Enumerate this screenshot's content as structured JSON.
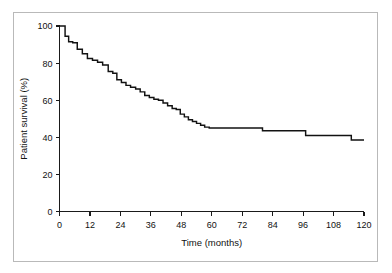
{
  "figure": {
    "frame_color": "#b9b9b9",
    "background": "#ffffff"
  },
  "chart_data": {
    "type": "line",
    "subtype": "kaplan-meier-step",
    "title": "",
    "xlabel": "Time (months)",
    "ylabel": "Patient survival (%)",
    "xlim": [
      0,
      120
    ],
    "ylim": [
      0,
      100
    ],
    "xticks": [
      0,
      12,
      24,
      36,
      48,
      60,
      72,
      84,
      96,
      108,
      120
    ],
    "xticklabels": [
      "0",
      "12",
      "24",
      "36",
      "48",
      "60",
      "72",
      "84",
      "96",
      "108",
      "120"
    ],
    "yticks": [
      0,
      20,
      40,
      60,
      80,
      100
    ],
    "yticklabels": [
      "0",
      "20",
      "40",
      "60",
      "80",
      "100"
    ],
    "grid": false,
    "legend": null,
    "line_color": "#121212",
    "series": [
      {
        "name": "Patient survival",
        "x": [
          0,
          0.8,
          2.2,
          3.6,
          5.2,
          7.0,
          9.0,
          11.0,
          13.0,
          15.0,
          17.0,
          19.2,
          21.0,
          22.6,
          24.4,
          26.2,
          28.0,
          30.0,
          31.8,
          33.6,
          35.4,
          37.2,
          39.0,
          40.8,
          42.6,
          44.4,
          46.0,
          47.6,
          49.2,
          50.8,
          52.4,
          54.0,
          55.6,
          57.2,
          59.0,
          79.5,
          80.0,
          96.5,
          97.0,
          114.5,
          115.0,
          120.0
        ],
        "y": [
          100.0,
          100.0,
          94.5,
          91.5,
          91.0,
          87.5,
          85.0,
          82.5,
          81.5,
          80.5,
          79.0,
          75.5,
          74.5,
          71.0,
          69.5,
          68.0,
          67.0,
          66.0,
          64.5,
          62.5,
          61.5,
          60.5,
          60.0,
          58.5,
          57.0,
          55.5,
          55.0,
          52.5,
          51.0,
          49.5,
          48.5,
          47.5,
          46.5,
          45.5,
          45.0,
          45.0,
          43.5,
          43.5,
          41.0,
          41.0,
          38.5,
          38.5
        ],
        "description": "Stepwise declining survival curve from 100% at baseline to about 38.5% at 120 months, with a plateau near 45% between 59 and 80 months."
      }
    ],
    "annotations": []
  }
}
